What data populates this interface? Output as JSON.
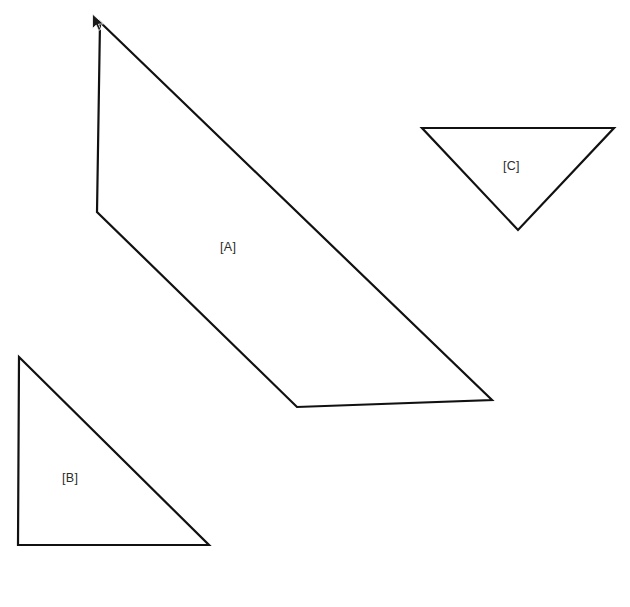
{
  "header": {
    "icon": "cube-icon",
    "title": "Build a Solum"
  },
  "cursor": {
    "name": "mouse-pointer-icon",
    "x": 91,
    "y": 13
  },
  "canvas": {
    "width": 630,
    "height": 607,
    "background": "#ffffff",
    "stroke_color": "#111111",
    "fill_color": "#ffffff"
  },
  "chart_data": {
    "type": "diagram",
    "title": "Build a Solum",
    "background": "#ffffff",
    "shapes": [
      {
        "id": "A",
        "label": "[A]",
        "kind": "quadrilateral",
        "label_position": {
          "x": 232,
          "y": 248
        },
        "stroke": "#111111",
        "fill": "none",
        "stroke_width": 2.2,
        "points": [
          {
            "x": 100,
            "y": 22
          },
          {
            "x": 492,
            "y": 400
          },
          {
            "x": 297,
            "y": 407
          },
          {
            "x": 97,
            "y": 212
          }
        ]
      },
      {
        "id": "B",
        "label": "[B]",
        "kind": "right-triangle",
        "label_position": {
          "x": 74,
          "y": 479
        },
        "stroke": "#111111",
        "fill": "none",
        "stroke_width": 2.2,
        "points": [
          {
            "x": 19,
            "y": 357
          },
          {
            "x": 209,
            "y": 545
          },
          {
            "x": 18,
            "y": 545
          }
        ]
      },
      {
        "id": "C",
        "label": "[C]",
        "kind": "inverted-triangle",
        "label_position": {
          "x": 515,
          "y": 167
        },
        "stroke": "#111111",
        "fill": "none",
        "stroke_width": 2.2,
        "points": [
          {
            "x": 422,
            "y": 128
          },
          {
            "x": 614,
            "y": 128
          },
          {
            "x": 518,
            "y": 230
          }
        ]
      }
    ]
  }
}
